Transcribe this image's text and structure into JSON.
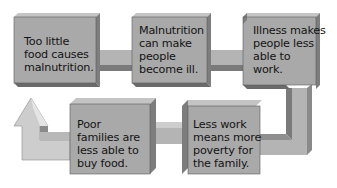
{
  "diagram": {
    "type": "cycle-flow",
    "colors": {
      "box_face": "#a9a9a9",
      "box_top": "#c4c4c4",
      "box_side": "#7d7d7d",
      "box_bottom": "#6a6a6a",
      "connector_face": "#b4b4b4",
      "connector_dark": "#7a7a7a",
      "arrow_face": "#cdcdcd",
      "text": "#141414",
      "background": "#ffffff"
    },
    "boxes": [
      {
        "id": "box1",
        "lines": [
          "Too little",
          "food causes",
          "malnutrition."
        ]
      },
      {
        "id": "box2",
        "lines": [
          "Malnutrition",
          "can make",
          "people",
          "become ill."
        ]
      },
      {
        "id": "box3",
        "lines": [
          "Illness makes",
          "people less",
          "able to",
          "work."
        ]
      },
      {
        "id": "box4",
        "lines": [
          "Less work",
          "means more",
          "poverty for",
          "the family."
        ]
      },
      {
        "id": "box5",
        "lines": [
          "Poor",
          "families are",
          "less able to",
          "buy food."
        ]
      }
    ],
    "flow": [
      "box1",
      "box2",
      "box3",
      "box4",
      "box5",
      "box1"
    ]
  }
}
